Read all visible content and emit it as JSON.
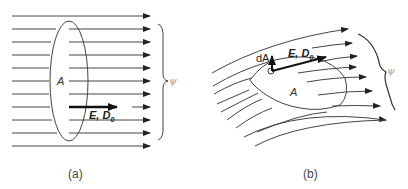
{
  "panels": [
    {
      "id": "a",
      "caption": "(a)",
      "area_label": "A",
      "field_label": "E, D",
      "field_sub": "0",
      "flux_label": "ψ",
      "field_line_count": 11,
      "description": "Uniform parallel field lines passing through a flat elliptical surface A"
    },
    {
      "id": "b",
      "caption": "(b)",
      "area_label": "A",
      "element_label": "dA",
      "field_label": "E, D",
      "field_sub": "0",
      "flux_label": "ψ",
      "field_line_count": 8,
      "description": "Curved non-uniform field lines passing through an irregular surface A with area element dA"
    }
  ],
  "colors": {
    "line": "#333333",
    "flux_label": "#999999",
    "background": "#ffffff"
  }
}
